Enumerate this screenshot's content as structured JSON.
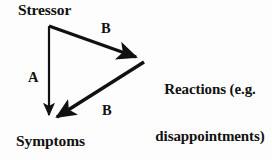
{
  "diagram": {
    "title_text": "",
    "background_color": "#fdfdfd",
    "stroke_color": "#111111",
    "nodes": {
      "stressor": {
        "label": "Stressor"
      },
      "symptoms": {
        "label": "Symptoms"
      },
      "reactions": {
        "line1": "Reactions (e.g.",
        "line2": "disappointments)"
      }
    },
    "edges": {
      "stressor_to_symptoms": {
        "label": "A"
      },
      "stressor_to_reactions": {
        "label": "B"
      },
      "reactions_to_symptoms": {
        "label": "B"
      }
    }
  }
}
